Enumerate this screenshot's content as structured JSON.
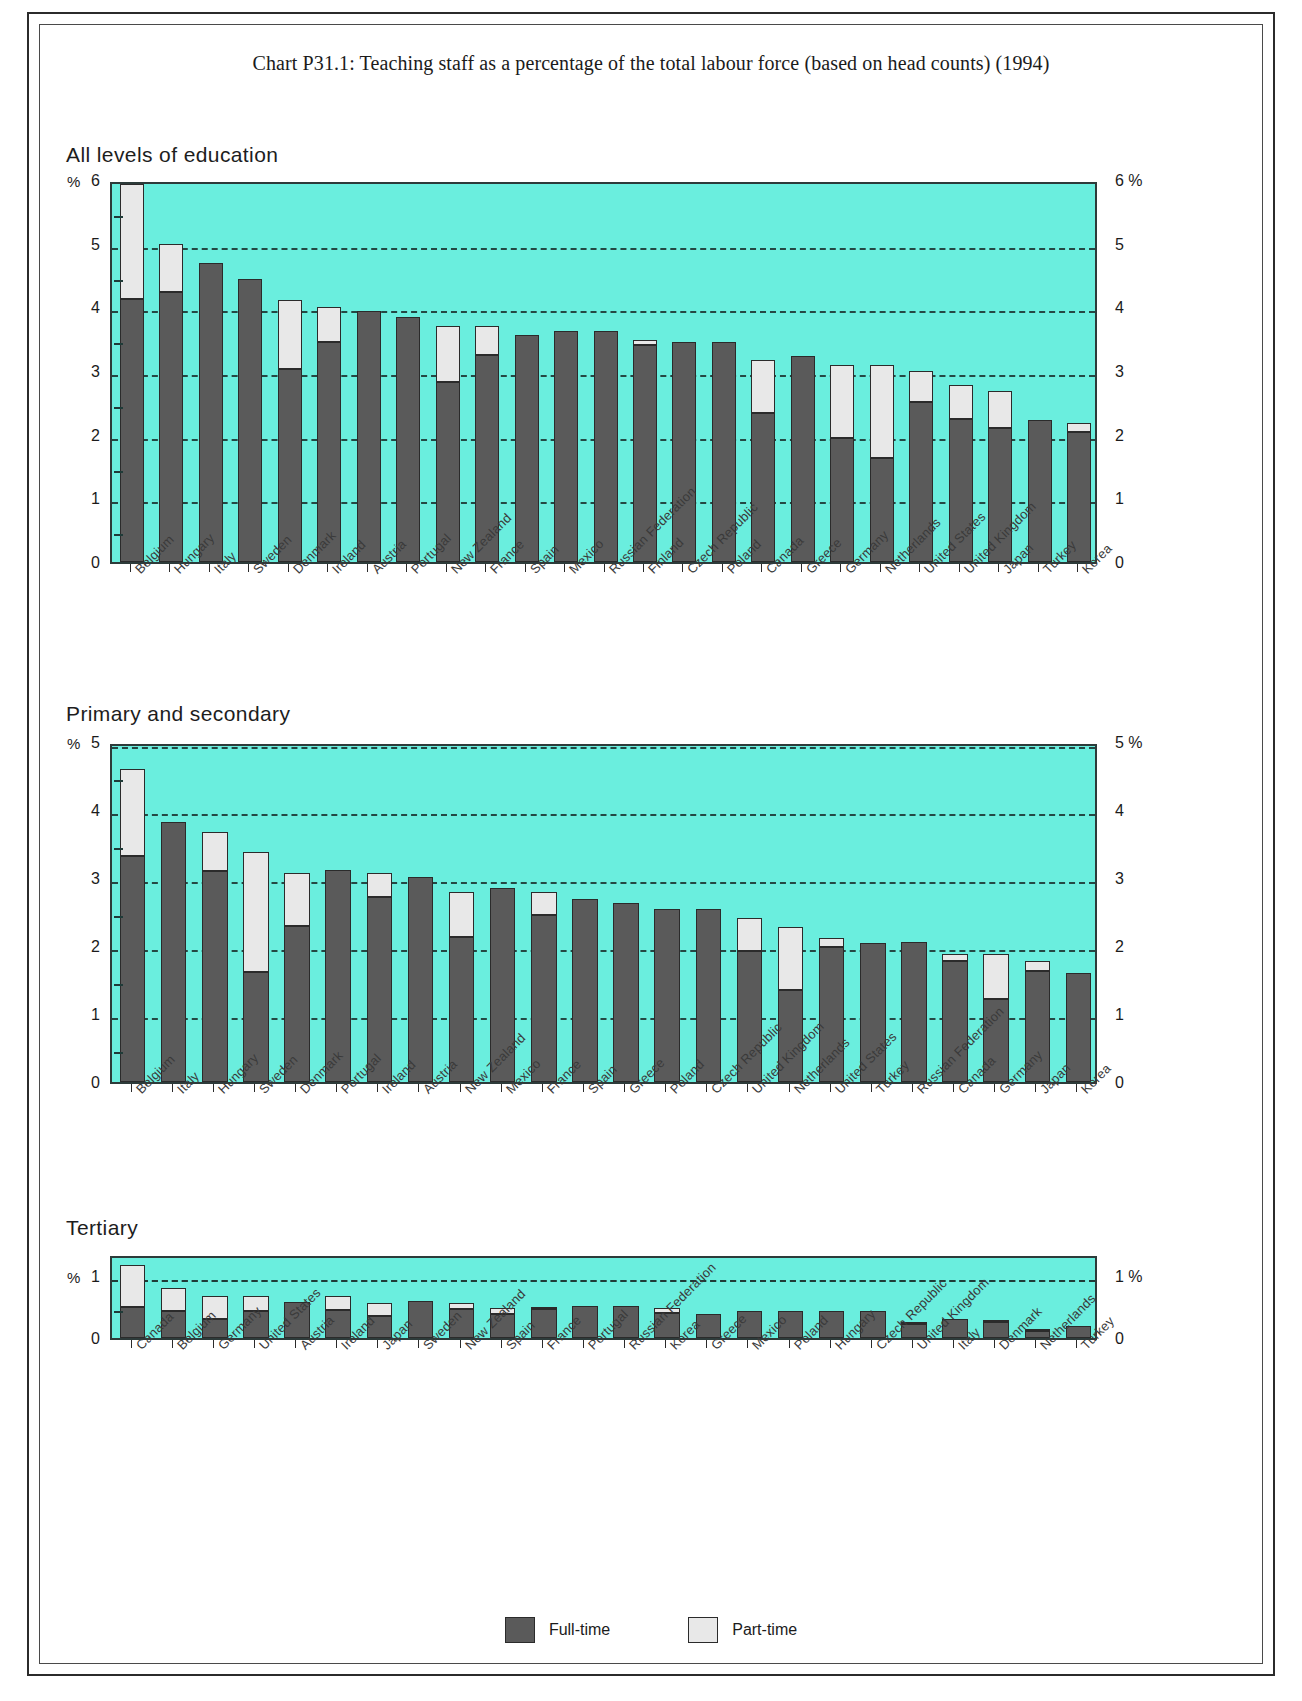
{
  "document": {
    "title": "Chart P31.1: Teaching staff as a percentage of the total labour force (based on head counts) (1994)"
  },
  "legend": {
    "full_time": "Full-time",
    "part_time": "Part-time"
  },
  "axis": {
    "percent_symbol": "%",
    "panel1_ticks": [
      "0",
      "1",
      "2",
      "3",
      "4",
      "5",
      "6"
    ],
    "panel1_right": [
      "0",
      "1",
      "2",
      "3",
      "4",
      "5",
      "6 %"
    ],
    "panel2_ticks": [
      "0",
      "1",
      "2",
      "3",
      "4",
      "5"
    ],
    "panel2_right": [
      "0",
      "1",
      "2",
      "3",
      "4",
      "5 %"
    ],
    "panel3_ticks": [
      "0",
      "1"
    ],
    "panel3_right": [
      "0",
      "1 %"
    ]
  },
  "panels": [
    {
      "heading": "All levels of education"
    },
    {
      "heading": "Primary and secondary"
    },
    {
      "heading": "Tertiary"
    }
  ],
  "colors": {
    "plot_background": "#6aeede",
    "full_time": "#5a5a5a",
    "part_time": "#e8e8e8",
    "outline": "#2b2b2b"
  },
  "chart_data": [
    {
      "type": "bar",
      "title": "All levels of education",
      "subtitle": "Chart P31.1: Teaching staff as a percentage of the total labour force (based on head counts) (1994)",
      "xlabel": "",
      "ylabel": "%",
      "ylim": [
        0,
        6
      ],
      "yticks": [
        0,
        1,
        2,
        3,
        4,
        5,
        6
      ],
      "grid": true,
      "stacked": true,
      "legend": [
        "Full-time",
        "Part-time"
      ],
      "legend_position": "bottom",
      "categories": [
        "Belgium",
        "Hungary",
        "Italy",
        "Sweden",
        "Denmark",
        "Ireland",
        "Austria",
        "Portugal",
        "New Zealand",
        "France",
        "Spain",
        "Mexico",
        "Russian Federation",
        "Finland",
        "Czech Republic",
        "Poland",
        "Canada",
        "Greece",
        "Germany",
        "Netherlands",
        "United States",
        "United Kingdom",
        "Japan",
        "Turkey",
        "Korea"
      ],
      "series": [
        {
          "name": "Full-time",
          "values": [
            4.13,
            4.24,
            4.7,
            4.44,
            3.03,
            3.45,
            3.94,
            3.85,
            2.83,
            3.25,
            3.56,
            3.63,
            3.63,
            3.41,
            3.46,
            3.46,
            2.34,
            3.23,
            1.95,
            1.64,
            2.51,
            2.25,
            2.1,
            2.23,
            2.04
          ]
        },
        {
          "name": "Part-time",
          "values": [
            1.8,
            0.75,
            0.0,
            0.0,
            1.08,
            0.55,
            0.0,
            0.0,
            0.87,
            0.45,
            0.0,
            0.0,
            0.0,
            0.07,
            0.0,
            0.0,
            0.84,
            0.0,
            1.15,
            1.46,
            0.49,
            0.53,
            0.59,
            0.0,
            0.15
          ]
        }
      ],
      "totals": [
        5.93,
        4.99,
        4.7,
        4.44,
        4.11,
        4.0,
        3.94,
        3.85,
        3.7,
        3.7,
        3.56,
        3.63,
        3.63,
        3.48,
        3.46,
        3.46,
        3.18,
        3.23,
        3.1,
        3.1,
        3.0,
        2.78,
        2.69,
        2.23,
        2.19
      ]
    },
    {
      "type": "bar",
      "title": "Primary and secondary",
      "xlabel": "",
      "ylabel": "%",
      "ylim": [
        0,
        5
      ],
      "yticks": [
        0,
        1,
        2,
        3,
        4,
        5
      ],
      "grid": true,
      "stacked": true,
      "legend": [
        "Full-time",
        "Part-time"
      ],
      "legend_position": "bottom",
      "categories": [
        "Belgium",
        "Italy",
        "Hungary",
        "Sweden",
        "Denmark",
        "Portugal",
        "Ireland",
        "Austria",
        "New Zealand",
        "Mexico",
        "France",
        "Spain",
        "Greece",
        "Poland",
        "Czech Republic",
        "United Kingdom",
        "Netherlands",
        "United States",
        "Turkey",
        "Russian Federation",
        "Canada",
        "Germany",
        "Japan",
        "Korea"
      ],
      "series": [
        {
          "name": "Full-time",
          "values": [
            3.33,
            3.82,
            3.11,
            1.62,
            2.3,
            3.12,
            2.72,
            3.02,
            2.14,
            2.85,
            2.45,
            2.69,
            2.63,
            2.54,
            2.54,
            1.92,
            1.35,
            1.99,
            2.05,
            2.06,
            1.78,
            1.22,
            1.64,
            1.61
          ]
        },
        {
          "name": "Part-time",
          "values": [
            1.27,
            0.0,
            0.57,
            1.77,
            0.78,
            0.0,
            0.36,
            0.0,
            0.66,
            0.0,
            0.35,
            0.0,
            0.0,
            0.0,
            0.0,
            0.49,
            0.93,
            0.13,
            0.0,
            0.0,
            0.1,
            0.67,
            0.14,
            0.0
          ]
        }
      ],
      "totals": [
        4.6,
        3.82,
        3.68,
        3.39,
        3.08,
        3.12,
        3.08,
        3.02,
        2.8,
        2.85,
        2.8,
        2.69,
        2.63,
        2.54,
        2.54,
        2.41,
        2.28,
        2.12,
        2.05,
        2.06,
        1.88,
        1.89,
        1.78,
        1.61
      ]
    },
    {
      "type": "bar",
      "title": "Tertiary",
      "xlabel": "",
      "ylabel": "%",
      "ylim": [
        0,
        1.35
      ],
      "yticks": [
        0,
        1
      ],
      "grid": true,
      "stacked": true,
      "legend": [
        "Full-time",
        "Part-time"
      ],
      "legend_position": "bottom",
      "categories": [
        "Canada",
        "Belgium",
        "Germany",
        "United States",
        "Austria",
        "Ireland",
        "Japan",
        "Sweden",
        "New Zealand",
        "Spain",
        "France",
        "Portugal",
        "Russian Federation",
        "Korea",
        "Greece",
        "Mexico",
        "Poland",
        "Hungary",
        "Czech Republic",
        "United Kingdom",
        "Italy",
        "Denmark",
        "Netherlands",
        "Turkey"
      ],
      "series": [
        {
          "name": "Full-time",
          "values": [
            0.5,
            0.43,
            0.3,
            0.43,
            0.58,
            0.45,
            0.36,
            0.6,
            0.47,
            0.38,
            0.47,
            0.52,
            0.52,
            0.4,
            0.39,
            0.44,
            0.44,
            0.44,
            0.44,
            0.23,
            0.3,
            0.25,
            0.12,
            0.2
          ]
        },
        {
          "name": "Part-time",
          "values": [
            0.67,
            0.38,
            0.38,
            0.25,
            0.0,
            0.22,
            0.21,
            0.0,
            0.09,
            0.11,
            0.03,
            0.0,
            0.0,
            0.09,
            0.0,
            0.0,
            0.0,
            0.0,
            0.0,
            0.03,
            0.0,
            0.03,
            0.02,
            0.0
          ]
        }
      ],
      "totals": [
        1.17,
        0.81,
        0.68,
        0.68,
        0.58,
        0.67,
        0.57,
        0.6,
        0.56,
        0.49,
        0.5,
        0.52,
        0.52,
        0.49,
        0.39,
        0.44,
        0.44,
        0.44,
        0.44,
        0.26,
        0.3,
        0.28,
        0.14,
        0.2
      ]
    }
  ]
}
